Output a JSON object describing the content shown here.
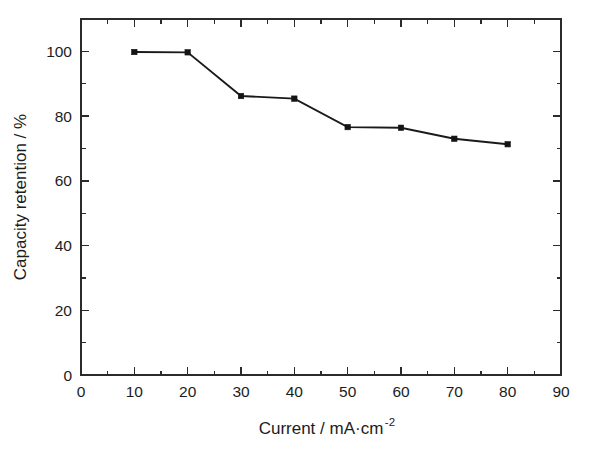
{
  "chart_data": {
    "type": "line",
    "title": "",
    "xlabel": "Current / mA·cm",
    "xlabel_exponent": "-2",
    "ylabel": "Capacity retention / %",
    "x": [
      10,
      20,
      30,
      40,
      50,
      60,
      70,
      80
    ],
    "values": [
      99.8,
      99.7,
      86.2,
      85.4,
      76.6,
      76.4,
      73.0,
      71.3
    ],
    "series": [
      {
        "name": "Capacity retention",
        "x": [
          10,
          20,
          30,
          40,
          50,
          60,
          70,
          80
        ],
        "values": [
          99.8,
          99.7,
          86.2,
          85.4,
          76.6,
          76.4,
          73.0,
          71.3
        ],
        "marker": "square",
        "color": "#141414"
      }
    ],
    "xlim": [
      0,
      90
    ],
    "ylim": [
      0,
      110
    ],
    "xticks": [
      0,
      10,
      20,
      30,
      40,
      50,
      60,
      70,
      80,
      90
    ],
    "yticks": [
      0,
      20,
      40,
      60,
      80,
      100
    ],
    "xtick_labels": [
      "0",
      "10",
      "20",
      "30",
      "40",
      "50",
      "60",
      "70",
      "80",
      "90"
    ],
    "ytick_labels": [
      "0",
      "20",
      "40",
      "60",
      "80",
      "100"
    ],
    "x_minor_interval": 5,
    "y_minor_interval": 10,
    "grid": false,
    "legend": null,
    "frame": "box",
    "tick_direction": "in"
  }
}
